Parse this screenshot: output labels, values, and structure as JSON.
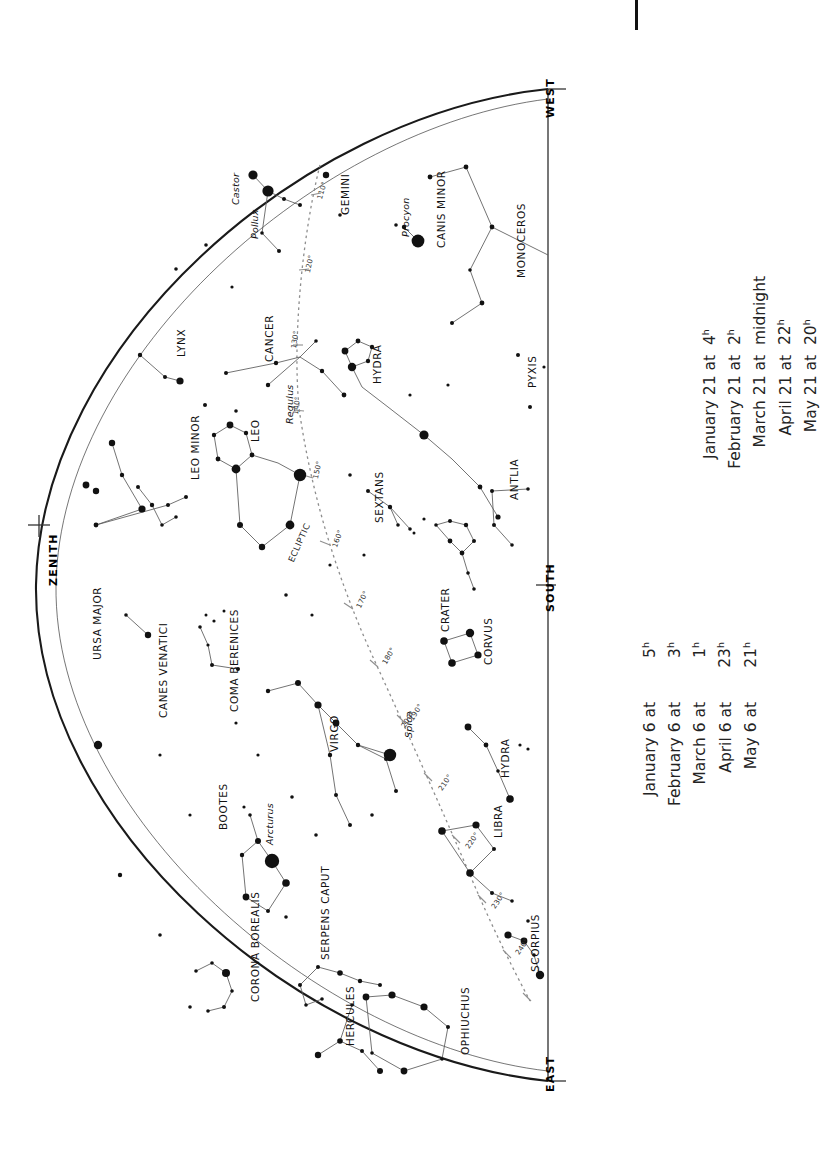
{
  "chart": {
    "type": "star-chart",
    "horizon_labels": {
      "zenith": "ZENITH",
      "west": "WEST",
      "south": "SOUTH",
      "east": "EAST"
    },
    "ecliptic_label": "ECLIPTIC",
    "ecliptic_degrees": [
      "110°",
      "120°",
      "130°",
      "140°",
      "150°",
      "160°",
      "170°",
      "180°",
      "190°",
      "200°",
      "210°",
      "220°",
      "230°",
      "240°"
    ],
    "constellations": [
      {
        "name": "GEMINI"
      },
      {
        "name": "CANIS MINOR"
      },
      {
        "name": "MONOCEROS"
      },
      {
        "name": "HYDRA"
      },
      {
        "name": "LYNX"
      },
      {
        "name": "CANCER"
      },
      {
        "name": "LEO"
      },
      {
        "name": "LEO MINOR"
      },
      {
        "name": "SEXTANS"
      },
      {
        "name": "PYXIS"
      },
      {
        "name": "ANTLIA"
      },
      {
        "name": "URSA MAJOR"
      },
      {
        "name": "CANES VENATICI"
      },
      {
        "name": "COMA BERENICES"
      },
      {
        "name": "CRATER"
      },
      {
        "name": "CORVUS"
      },
      {
        "name": "VIRGO"
      },
      {
        "name": "HYDRA"
      },
      {
        "name": "BOOTES"
      },
      {
        "name": "LIBRA"
      },
      {
        "name": "CORONA BOREALIS"
      },
      {
        "name": "SERPENS CAPUT"
      },
      {
        "name": "SCORPIUS"
      },
      {
        "name": "HERCULES"
      },
      {
        "name": "OPHIUCHUS"
      }
    ],
    "named_stars": [
      {
        "name": "Castor"
      },
      {
        "name": "Pollux"
      },
      {
        "name": "Procyon"
      },
      {
        "name": "Regulus"
      },
      {
        "name": "Arcturus"
      },
      {
        "name": "Spica"
      }
    ]
  },
  "legend_left": {
    "rows": [
      {
        "when": "January 6 at",
        "hour": "5",
        "sup": "h"
      },
      {
        "when": "February 6 at",
        "hour": "3",
        "sup": "h"
      },
      {
        "when": "March 6 at",
        "hour": "1",
        "sup": "h"
      },
      {
        "when": "April 6 at",
        "hour": "23",
        "sup": "h"
      },
      {
        "when": "May 6 at",
        "hour": "21",
        "sup": "h"
      }
    ]
  },
  "legend_right": {
    "rows": [
      {
        "when": "January 21 at",
        "hour": "4",
        "sup": "h"
      },
      {
        "when": "February 21 at",
        "hour": "2",
        "sup": "h"
      },
      {
        "when": "March 21 at",
        "hour": "midnight",
        "sup": ""
      },
      {
        "when": "April 21 at",
        "hour": "22",
        "sup": "h"
      },
      {
        "when": "May 21 at",
        "hour": "20",
        "sup": "h"
      }
    ]
  },
  "colors": {
    "ink": "#111111",
    "line": "#555555",
    "ecliptic": "#999999",
    "background": "#ffffff"
  }
}
